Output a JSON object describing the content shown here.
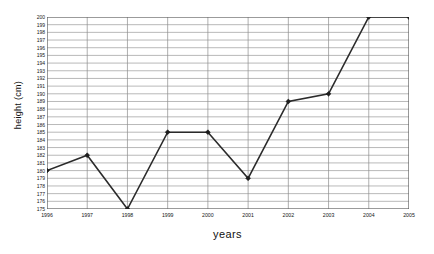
{
  "chart_data": {
    "type": "line",
    "title": "",
    "xlabel": "years",
    "ylabel": "height (cm)",
    "categories": [
      "1996",
      "1997",
      "1998",
      "1999",
      "2000",
      "2001",
      "2002",
      "2003",
      "2004",
      "2005"
    ],
    "values": [
      180,
      182,
      175,
      185,
      185,
      179,
      189,
      190,
      200,
      200
    ],
    "series": [
      {
        "name": "height",
        "values": [
          180,
          182,
          175,
          185,
          185,
          179,
          189,
          190,
          200,
          200
        ]
      }
    ],
    "ylim": [
      175,
      200
    ],
    "ytick_step": 1,
    "yticks": [
      200,
      199,
      198,
      197,
      196,
      195,
      194,
      193,
      192,
      191,
      190,
      189,
      188,
      187,
      186,
      185,
      184,
      183,
      182,
      181,
      180,
      179,
      178,
      177,
      176,
      175
    ],
    "xticks": [
      "1996",
      "1997",
      "1998",
      "1999",
      "2000",
      "2001",
      "2002",
      "2003",
      "2004",
      "2005"
    ],
    "grid": true,
    "grid_horizontal": true,
    "grid_vertical": true,
    "legend": false,
    "legend_position": "none",
    "marker": "diamond",
    "line_color": "#2b2b2b",
    "marker_color": "#1d1d1d",
    "grid_color": "#9b9b9b",
    "background_color": "#ffffff"
  }
}
